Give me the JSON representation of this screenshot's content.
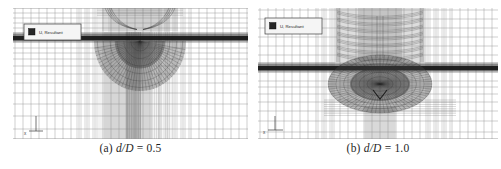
{
  "figure": {
    "panels": [
      {
        "id": "a",
        "caption_index": "(a) ",
        "caption_var": "d/D",
        "caption_eq": " = 0.5",
        "legend_label": "U, Resultant",
        "axis_label": "x"
      },
      {
        "id": "b",
        "caption_index": "(b) ",
        "caption_var": "d/D",
        "caption_eq": " = 1.0",
        "legend_label": "U, Resultant",
        "axis_label": "x"
      }
    ]
  },
  "colors": {
    "background": "#ffffff",
    "grid_line": "#8f8f8f",
    "dense_line": "#3a3a3a",
    "band_dark": "#0e0e0e",
    "shade_light": "#d8d8d8",
    "shade_core": "#b4b4b4",
    "legend_fill": "#f5f5f5",
    "legend_border": "#3c3c3c",
    "legend_swatch": "#262626",
    "caption_text": "#1f1f1f"
  }
}
